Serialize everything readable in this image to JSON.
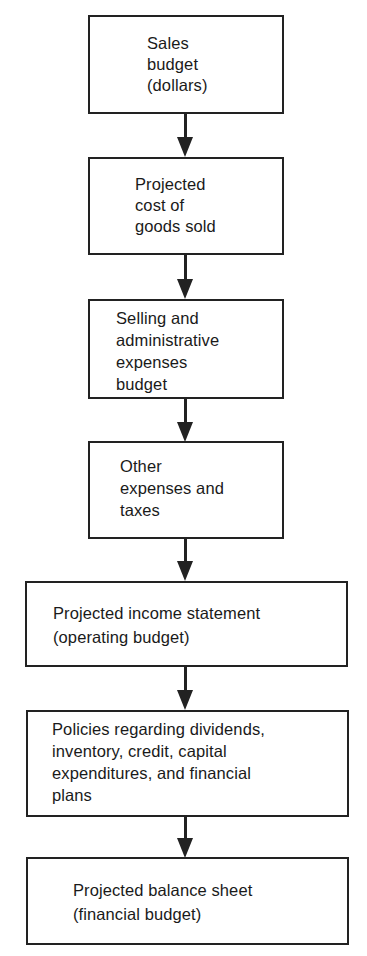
{
  "diagram": {
    "type": "flowchart",
    "direction": "top-to-bottom",
    "colors": {
      "stroke": "#222222",
      "background": "#ffffff",
      "text": "#1a1a1a"
    },
    "nodes": [
      {
        "id": "sales-budget",
        "lines": [
          "Sales",
          "budget",
          "(dollars)"
        ],
        "text": "Sales\nbudget\n(dollars)"
      },
      {
        "id": "cost-of-goods-sold",
        "lines": [
          "Projected",
          "cost of",
          "goods sold"
        ],
        "text": "Projected\ncost of\ngoods sold"
      },
      {
        "id": "selling-admin-expenses",
        "lines": [
          "Selling and",
          "administrative",
          "expenses",
          "budget"
        ],
        "text": "Selling and\nadministrative\nexpenses\nbudget"
      },
      {
        "id": "other-expenses-taxes",
        "lines": [
          "Other",
          "expenses and",
          "taxes"
        ],
        "text": "Other\nexpenses and\ntaxes"
      },
      {
        "id": "projected-income-statement",
        "lines": [
          "Projected income statement",
          "(operating budget)"
        ],
        "text": "Projected income statement\n(operating budget)"
      },
      {
        "id": "policies",
        "lines": [
          "Policies regarding dividends,",
          "inventory, credit, capital",
          "expenditures, and financial",
          "plans"
        ],
        "text": "Policies regarding dividends,\ninventory, credit, capital\nexpenditures, and financial\nplans"
      },
      {
        "id": "projected-balance-sheet",
        "lines": [
          "Projected balance sheet",
          "(financial budget)"
        ],
        "text": "Projected balance sheet\n(financial budget)"
      }
    ],
    "edges": [
      {
        "from": "sales-budget",
        "to": "cost-of-goods-sold"
      },
      {
        "from": "cost-of-goods-sold",
        "to": "selling-admin-expenses"
      },
      {
        "from": "selling-admin-expenses",
        "to": "other-expenses-taxes"
      },
      {
        "from": "other-expenses-taxes",
        "to": "projected-income-statement"
      },
      {
        "from": "projected-income-statement",
        "to": "policies"
      },
      {
        "from": "policies",
        "to": "projected-balance-sheet"
      }
    ]
  }
}
